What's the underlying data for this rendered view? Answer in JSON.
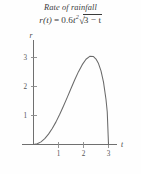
{
  "figure": {
    "title": "Rate of rainfall",
    "formula": {
      "lhs": "r(t)",
      "equals": "=",
      "coefficient": "0.6",
      "variable": "t",
      "exponent": "2",
      "radicand": "3 − t"
    }
  },
  "chart_data": {
    "type": "line",
    "title": "Rate of rainfall",
    "equation": "r(t) = 0.6t^2√(3−t)",
    "xlabel": "t",
    "ylabel": "r",
    "xlim": [
      0,
      3.35
    ],
    "ylim": [
      0,
      3.45
    ],
    "xticks": [
      "1",
      "2",
      "3"
    ],
    "xtick_values": [
      1,
      2,
      3
    ],
    "yticks": [
      "1",
      "2",
      "3"
    ],
    "ytick_values": [
      1,
      2,
      3
    ],
    "grid": false,
    "legend": null,
    "series": [
      {
        "name": "r(t) = 0.6t²√(3−t)",
        "color": "#6a6a6a",
        "x": [
          0,
          0.15,
          0.3,
          0.45,
          0.6,
          0.75,
          0.9,
          1.05,
          1.2,
          1.35,
          1.5,
          1.65,
          1.8,
          1.95,
          2.1,
          2.25,
          2.4,
          2.5,
          2.6,
          2.7,
          2.8,
          2.9,
          2.95,
          3
        ],
        "y": [
          0,
          0.023,
          0.091,
          0.203,
          0.357,
          0.551,
          0.78,
          1.04,
          1.325,
          1.626,
          1.932,
          2.232,
          2.512,
          2.754,
          2.939,
          3.04,
          3.031,
          2.947,
          2.79,
          2.537,
          2.151,
          1.551,
          1.123,
          0
        ]
      }
    ],
    "annotations": {
      "peak_t": 2.4,
      "peak_r": 3.03,
      "zero_t": 3
    }
  }
}
